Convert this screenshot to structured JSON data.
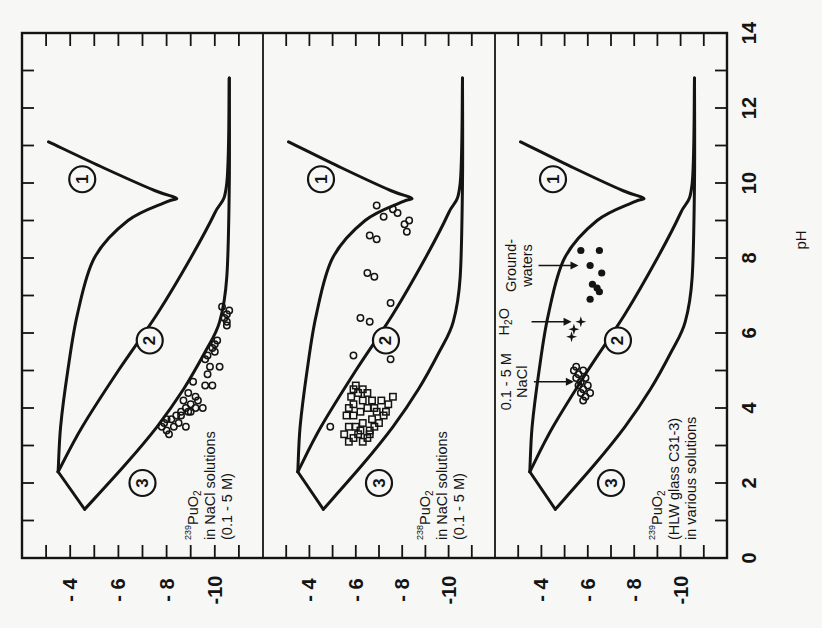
{
  "figure": {
    "orientation": "rotated 90 degrees counter-clockwise",
    "ph_axis": {
      "label": "pH",
      "ticks": [
        "0",
        "2",
        "4",
        "6",
        "8",
        "10",
        "12",
        "14"
      ]
    },
    "conc_axis_ticks": [
      "- 4",
      "- 6",
      "- 8",
      "-10"
    ],
    "region_labels": [
      "1",
      "2",
      "3"
    ]
  },
  "chart_data": [
    {
      "type": "scatter",
      "panel": 1,
      "title": "239PuO2 in NaCl solutions (0.1 - 5 M)",
      "annotation_lines": [
        "PuO",
        "in NaCl solutions",
        "(0.1 - 5 M)"
      ],
      "isotope": "239",
      "xlabel": "pH",
      "ylabel": "log concentration",
      "xlim": [
        0,
        14
      ],
      "ylim": [
        -12,
        -2
      ],
      "yticks": [
        -4,
        -6,
        -8,
        -10
      ],
      "xticks": [
        0,
        2,
        4,
        6,
        8,
        10,
        12,
        14
      ],
      "grid": false,
      "region_curves": {
        "curve_1_upper": {
          "pH": [
            11.1,
            10.4,
            9.8,
            9.6,
            9.5,
            9.0,
            8.0,
            6.5,
            5.0,
            3.5,
            2.3
          ],
          "logC": [
            -3.1,
            -5.4,
            -7.5,
            -8.4,
            -8.0,
            -6.4,
            -5.0,
            -4.3,
            -3.9,
            -3.6,
            -3.5
          ]
        },
        "curve_2_middle": {
          "pH": [
            2.3,
            3.5,
            5.0,
            6.5,
            8.0,
            9.2,
            10.0,
            12.8
          ],
          "logC": [
            -3.5,
            -4.5,
            -6.0,
            -7.6,
            -9.0,
            -10.0,
            -10.5,
            -10.6
          ]
        },
        "curve_3_lower": {
          "pH": [
            1.3,
            2.5,
            3.5,
            4.5,
            5.5,
            6.3,
            7.5,
            10.0,
            12.8
          ],
          "logC": [
            -4.6,
            -6.3,
            -7.6,
            -8.7,
            -9.6,
            -10.2,
            -10.5,
            -10.6,
            -10.6
          ]
        }
      },
      "series": [
        {
          "name": "239PuO2 data (open circles)",
          "marker": "open-circle",
          "pH": [
            3.4,
            3.5,
            3.6,
            3.7,
            3.6,
            3.8,
            3.9,
            4.0,
            3.7,
            3.5,
            3.8,
            4.1,
            4.2,
            4.3,
            3.9,
            4.0,
            4.4,
            4.6,
            4.9,
            4.6,
            4.2,
            5.1,
            5.5,
            5.6,
            5.7,
            5.8,
            5.3,
            5.1,
            6.3,
            6.5,
            6.6,
            6.7,
            6.4,
            6.2,
            4.0,
            3.3,
            3.5,
            3.9,
            4.7,
            5.4
          ],
          "logC": [
            -8.0,
            -8.3,
            -8.5,
            -8.2,
            -7.9,
            -8.6,
            -8.9,
            -8.8,
            -8.0,
            -7.8,
            -8.4,
            -9.0,
            -8.7,
            -9.2,
            -8.6,
            -9.5,
            -8.9,
            -9.6,
            -9.7,
            -9.9,
            -9.3,
            -9.8,
            -10.0,
            -9.9,
            -10.0,
            -10.1,
            -9.6,
            -10.2,
            -10.5,
            -10.5,
            -10.6,
            -10.3,
            -10.4,
            -10.5,
            -9.2,
            -8.1,
            -8.8,
            -9.0,
            -9.1,
            -9.7
          ]
        }
      ]
    },
    {
      "type": "scatter",
      "panel": 2,
      "title": "238PuO2 in NaCl solutions (0.1 - 5 M)",
      "annotation_lines": [
        "PuO",
        "in NaCl solutions",
        "(0.1 - 5 M)"
      ],
      "isotope": "238",
      "xlabel": "pH",
      "ylabel": "log concentration",
      "xlim": [
        0,
        14
      ],
      "ylim": [
        -12,
        -2
      ],
      "yticks": [
        -4,
        -6,
        -8,
        -10
      ],
      "xticks": [
        0,
        2,
        4,
        6,
        8,
        10,
        12,
        14
      ],
      "grid": false,
      "region_curves": {
        "curve_1_upper": {
          "pH": [
            11.1,
            10.4,
            9.8,
            9.6,
            9.5,
            9.0,
            8.0,
            6.5,
            5.0,
            3.5,
            2.3
          ],
          "logC": [
            -3.1,
            -5.4,
            -7.5,
            -8.4,
            -8.0,
            -6.4,
            -5.0,
            -4.3,
            -3.9,
            -3.6,
            -3.5
          ]
        },
        "curve_2_middle": {
          "pH": [
            2.3,
            3.5,
            5.0,
            6.5,
            8.0,
            9.2,
            10.0,
            12.8
          ],
          "logC": [
            -3.5,
            -4.5,
            -6.0,
            -7.6,
            -9.0,
            -10.0,
            -10.5,
            -10.6
          ]
        },
        "curve_3_lower": {
          "pH": [
            1.3,
            2.5,
            3.5,
            4.5,
            5.5,
            6.3,
            7.5,
            10.0,
            12.8
          ],
          "logC": [
            -4.6,
            -6.3,
            -7.6,
            -8.7,
            -9.6,
            -10.2,
            -10.5,
            -10.6,
            -10.6
          ]
        }
      },
      "series": [
        {
          "name": "238PuO2 data (open circles)",
          "marker": "open-circle",
          "pH": [
            9.4,
            9.1,
            9.3,
            9.2,
            8.9,
            8.6,
            8.5,
            7.6,
            7.5,
            6.8,
            6.4,
            6.3,
            5.4,
            5.3,
            3.5,
            9.0,
            8.7
          ],
          "logC": [
            -6.9,
            -7.2,
            -7.6,
            -7.8,
            -8.1,
            -6.6,
            -6.9,
            -6.5,
            -6.8,
            -7.5,
            -6.2,
            -6.6,
            -5.9,
            -7.5,
            -4.9,
            -8.3,
            -8.2
          ]
        },
        {
          "name": "238PuO2 data (open squares)",
          "marker": "open-square",
          "pH": [
            3.1,
            3.2,
            3.3,
            3.1,
            3.2,
            3.4,
            3.5,
            3.6,
            3.3,
            3.8,
            3.9,
            4.0,
            4.1,
            4.2,
            4.3,
            4.4,
            4.5,
            4.2,
            4.0,
            3.7,
            3.8,
            3.9,
            4.1,
            4.3,
            3.6,
            3.5,
            3.4,
            4.5,
            4.4,
            4.6,
            4.0,
            3.8,
            3.5,
            3.3,
            4.2,
            3.9
          ],
          "logC": [
            -5.7,
            -5.9,
            -6.1,
            -6.3,
            -6.5,
            -6.2,
            -6.0,
            -6.3,
            -6.6,
            -5.9,
            -6.2,
            -6.5,
            -5.9,
            -6.3,
            -5.8,
            -6.1,
            -5.9,
            -6.7,
            -6.8,
            -6.7,
            -7.2,
            -7.3,
            -7.4,
            -7.6,
            -7.0,
            -6.8,
            -6.6,
            -6.3,
            -6.5,
            -6.0,
            -5.7,
            -5.6,
            -5.7,
            -5.5,
            -7.1,
            -6.9
          ]
        }
      ]
    },
    {
      "type": "scatter",
      "panel": 3,
      "title": "239PuO2 (HLW glass C31-3) in various solutions",
      "annotation_lines": [
        "PuO",
        "(HLW glass C31-3)",
        "in various solutions"
      ],
      "isotope": "239",
      "xlabel": "pH",
      "ylabel": "log concentration",
      "xlim": [
        0,
        14
      ],
      "ylim": [
        -12,
        -2
      ],
      "yticks": [
        -4,
        -6,
        -8,
        -10
      ],
      "xticks": [
        0,
        2,
        4,
        6,
        8,
        10,
        12,
        14
      ],
      "grid": false,
      "region_curves": {
        "curve_1_upper": {
          "pH": [
            11.1,
            10.4,
            9.8,
            9.6,
            9.5,
            9.0,
            8.0,
            6.5,
            5.0,
            3.5,
            2.3
          ],
          "logC": [
            -3.1,
            -5.4,
            -7.5,
            -8.4,
            -8.0,
            -6.4,
            -5.0,
            -4.3,
            -3.9,
            -3.6,
            -3.5
          ]
        },
        "curve_2_middle": {
          "pH": [
            2.3,
            3.5,
            5.0,
            6.5,
            8.0,
            9.2,
            10.0,
            12.8
          ],
          "logC": [
            -3.5,
            -4.5,
            -6.0,
            -7.6,
            -9.0,
            -10.0,
            -10.5,
            -10.6
          ]
        },
        "curve_3_lower": {
          "pH": [
            1.3,
            2.5,
            3.5,
            4.5,
            5.5,
            6.3,
            7.5,
            10.0,
            12.8
          ],
          "logC": [
            -4.6,
            -6.3,
            -7.6,
            -8.7,
            -9.6,
            -10.2,
            -10.5,
            -10.6,
            -10.6
          ]
        }
      },
      "annotations": [
        {
          "text": "0.1 - 5 M NaCl",
          "lines": [
            "0.1 - 5 M",
            "NaCl"
          ],
          "arrow_to": {
            "pH": 4.7,
            "logC": -5.4
          }
        },
        {
          "text": "H2O",
          "lines": [
            "H",
            "O"
          ],
          "arrow_to": {
            "pH": 6.3,
            "logC": -5.3
          }
        },
        {
          "text": "Ground-waters",
          "lines": [
            "Ground-",
            "waters"
          ],
          "arrow_to": {
            "pH": 7.8,
            "logC": -5.6
          }
        }
      ],
      "series": [
        {
          "name": "0.1 - 5 M NaCl (open circles)",
          "marker": "open-circle",
          "pH": [
            5.1,
            5.0,
            4.9,
            4.8,
            4.7,
            4.6,
            4.5,
            4.4,
            4.3,
            4.2,
            5.0,
            4.8,
            4.6,
            4.4
          ],
          "logC": [
            -5.5,
            -5.4,
            -5.6,
            -5.5,
            -5.7,
            -5.6,
            -5.8,
            -5.7,
            -5.9,
            -5.8,
            -5.8,
            -5.9,
            -6.0,
            -6.1
          ]
        },
        {
          "name": "H2O (filled stars)",
          "marker": "filled-star",
          "pH": [
            6.1,
            6.3,
            5.9
          ],
          "logC": [
            -5.4,
            -5.7,
            -5.3
          ]
        },
        {
          "name": "Groundwaters (filled circles)",
          "marker": "filled-circle",
          "pH": [
            8.2,
            8.2,
            7.8,
            7.6,
            7.3,
            7.2,
            7.1,
            6.9
          ],
          "logC": [
            -5.7,
            -6.5,
            -6.1,
            -6.6,
            -6.2,
            -6.4,
            -6.5,
            -6.1
          ]
        }
      ]
    }
  ]
}
